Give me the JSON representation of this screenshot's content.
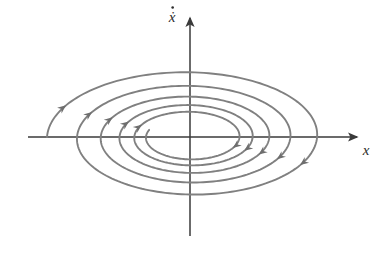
{
  "figure": {
    "background_color": "#ffffff",
    "axis_color": "#3a3a3a",
    "trajectory_color": "#808080",
    "arrow_color": "#6e6e6e",
    "label_color": "#2b2b2b"
  },
  "axes": {
    "origin": {
      "x": 190,
      "y": 137
    },
    "horizontal": {
      "label": "x",
      "name": "x-axis",
      "start_x": 28,
      "end_x": 357,
      "label_x": 366,
      "label_y": 155
    },
    "vertical": {
      "label": "ẋ",
      "label_plain": "x-dot",
      "name": "x-dot-axis",
      "start_y": 236,
      "end_y": 18,
      "label_x": 172,
      "label_y": 22
    }
  },
  "chart_data": {
    "type": "line",
    "title": "",
    "xlabel": "x",
    "ylabel": "ẋ",
    "grid": false,
    "legend": false,
    "equilibrium": {
      "type": "stable-spiral",
      "x": 0,
      "y": 0
    },
    "flow_direction": "clockwise",
    "convergence": "inward",
    "turns": 5,
    "axis_crossings": {
      "negative_x": [
        -143,
        -118,
        -93,
        -68,
        -38
      ],
      "positive_x": [
        140,
        115,
        90,
        63,
        35
      ]
    },
    "spiral_params": {
      "a_start": 143,
      "b_start": 69,
      "decay_per_turn": 0.79,
      "aspect_ratio": 0.48,
      "theta_start_deg": 180,
      "theta_end_deg": 2000
    },
    "arrowheads": {
      "count": 10,
      "upper_left_count": 5,
      "lower_right_count": 5
    }
  }
}
